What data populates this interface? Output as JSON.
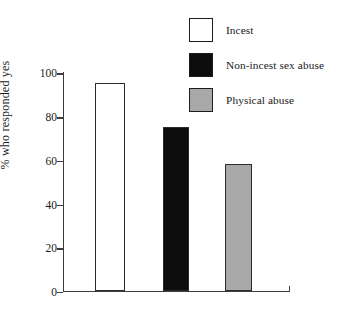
{
  "chart_data": {
    "type": "bar",
    "title": "",
    "xlabel": "",
    "ylabel": "% who responded yes",
    "ylim": [
      0,
      100
    ],
    "yticks": [
      0,
      20,
      40,
      60,
      80,
      100
    ],
    "ytick_labels": [
      "0",
      "20",
      "40",
      "60",
      "80",
      "100"
    ],
    "grid": false,
    "legend_position": "top-right",
    "categories": [
      "Incest",
      "Non-incest sex abuse",
      "Physical abuse"
    ],
    "values": [
      95,
      75,
      58
    ],
    "bar_colors": [
      "#ffffff",
      "#0d0d0d",
      "#a8a8a8"
    ],
    "bar_edge_color": "#2b2b2b",
    "axis_color": "#3d3d3d",
    "text_color": "#1a1a1a"
  },
  "legend": {
    "items": [
      {
        "label": "Incest",
        "color": "#ffffff"
      },
      {
        "label": "Non-incest sex abuse",
        "color": "#0d0d0d"
      },
      {
        "label": "Physical abuse",
        "color": "#a8a8a8"
      }
    ]
  },
  "axis": {
    "y_title": "% who responded yes",
    "ticks": [
      {
        "label": "100",
        "value": 100
      },
      {
        "label": "80",
        "value": 80
      },
      {
        "label": "60",
        "value": 60
      },
      {
        "label": "40",
        "value": 40
      },
      {
        "label": "20",
        "value": 20
      },
      {
        "label": "0",
        "value": 0
      }
    ]
  }
}
